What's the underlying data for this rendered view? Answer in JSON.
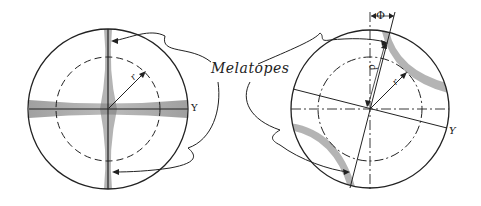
{
  "figure": {
    "callout_label": "Melatopes",
    "left_diagram": {
      "axis_label": "Y",
      "radius_label": "r"
    },
    "right_diagram": {
      "axis_label": "Y",
      "radius_label": "r",
      "distance_label": "d",
      "angle_label": "Φ"
    },
    "colors": {
      "line": "#222222",
      "shading": "#8a8a8a",
      "background": "#ffffff"
    }
  }
}
